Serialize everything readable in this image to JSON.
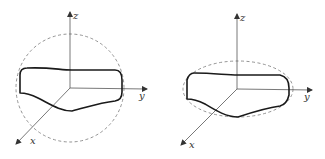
{
  "figure": {
    "panels": [
      {
        "id": "left",
        "bounding_shape": "circle",
        "axis_labels": {
          "x": "x",
          "y": "y",
          "z": "z"
        }
      },
      {
        "id": "right",
        "bounding_shape": "ellipse",
        "axis_labels": {
          "x": "x",
          "y": "y",
          "z": "z"
        }
      }
    ],
    "colors": {
      "axis": "#555555",
      "curve": "#1a1a1a",
      "bound": "#888888"
    }
  }
}
